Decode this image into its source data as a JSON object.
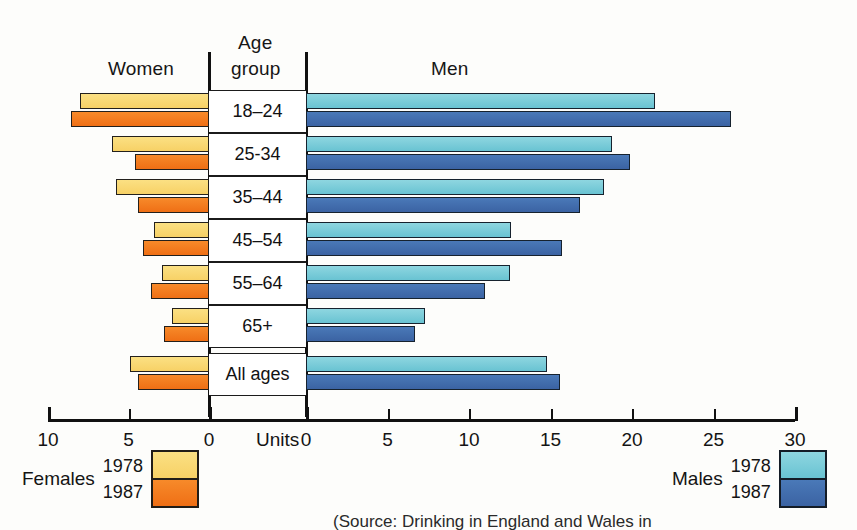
{
  "header": {
    "women_label": "Women",
    "age_group_line1": "Age",
    "age_group_line2": "group",
    "men_label": "Men"
  },
  "axis": {
    "units_label": "Units",
    "left_ticks": [
      "10",
      "5",
      "0"
    ],
    "right_ticks": [
      "0",
      "5",
      "10",
      "15",
      "20",
      "25",
      "30"
    ],
    "left_max": 10,
    "right_max": 30
  },
  "legend": {
    "females": {
      "title": "Females",
      "year_1978": "1978",
      "year_1987": "1987"
    },
    "males": {
      "title": "Males",
      "year_1978": "1978",
      "year_1987": "1987"
    }
  },
  "source": "(Source: Drinking in England and Wales in",
  "colors": {
    "female_1978": "#f7d166",
    "female_1987": "#ef6f15",
    "male_1978": "#69c3d2",
    "male_1987": "#3b63a3",
    "outline": "#211d18",
    "axis": "#111111"
  },
  "chart_data": {
    "type": "bar",
    "subtype": "population-pyramid",
    "orientation": "horizontal-bidirectional",
    "title": "",
    "xlabel": "Units",
    "ylabel": "Age group",
    "grid": false,
    "legend_position": "bottom",
    "categories": [
      "18–24",
      "25-34",
      "35–44",
      "45–54",
      "55–64",
      "65+",
      "All ages"
    ],
    "left_panel": {
      "name": "Women",
      "axis_range": [
        0,
        10
      ],
      "axis_direction": "right-to-left",
      "series": [
        {
          "name": "1978",
          "color": "#f7d166",
          "values": [
            8.0,
            6.0,
            5.8,
            3.4,
            2.9,
            2.3,
            4.9
          ]
        },
        {
          "name": "1987",
          "color": "#ef6f15",
          "values": [
            8.6,
            4.6,
            4.4,
            4.1,
            3.6,
            2.8,
            4.4
          ]
        }
      ]
    },
    "right_panel": {
      "name": "Men",
      "axis_range": [
        0,
        30
      ],
      "axis_direction": "left-to-right",
      "series": [
        {
          "name": "1978",
          "color": "#69c3d2",
          "values": [
            21.4,
            18.8,
            18.3,
            12.6,
            12.5,
            7.3,
            14.8
          ]
        },
        {
          "name": "1987",
          "color": "#3b63a3",
          "values": [
            26.1,
            19.9,
            16.8,
            15.7,
            11.0,
            6.7,
            15.6
          ]
        }
      ]
    }
  }
}
